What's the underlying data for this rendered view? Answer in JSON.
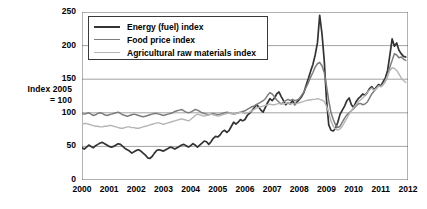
{
  "chart_data": {
    "type": "line",
    "title": "",
    "xlabel": "",
    "ylabel": "Index 2005 = 100",
    "ylabel_lines": [
      "Index 2005",
      "= 100"
    ],
    "ylim": [
      0,
      250
    ],
    "xlim": [
      2000,
      2012
    ],
    "yticks": [
      0,
      50,
      100,
      150,
      200,
      250
    ],
    "xticks": [
      2000,
      2001,
      2002,
      2003,
      2004,
      2005,
      2006,
      2007,
      2008,
      2009,
      2010,
      2011,
      2012
    ],
    "grid": "horizontal",
    "legend_position": "top-left-inside",
    "series": [
      {
        "name": "Energy (fuel) index",
        "color": "#333333",
        "width": 1.7,
        "x_start": 2000.0,
        "x_step": 0.08333,
        "values": [
          48,
          46,
          49,
          52,
          50,
          48,
          51,
          53,
          55,
          56,
          54,
          52,
          50,
          49,
          50,
          52,
          54,
          53,
          50,
          47,
          45,
          43,
          40,
          42,
          44,
          45,
          43,
          40,
          37,
          33,
          32,
          35,
          40,
          44,
          45,
          44,
          43,
          45,
          47,
          49,
          48,
          46,
          48,
          50,
          52,
          53,
          51,
          49,
          51,
          54,
          52,
          49,
          52,
          55,
          58,
          57,
          53,
          57,
          62,
          65,
          64,
          67,
          72,
          74,
          71,
          74,
          80,
          86,
          83,
          86,
          90,
          88,
          90,
          96,
          99,
          103,
          107,
          112,
          109,
          104,
          101,
          108,
          115,
          121,
          118,
          122,
          128,
          131,
          124,
          118,
          112,
          115,
          113,
          118,
          112,
          116,
          120,
          124,
          130,
          141,
          151,
          162,
          172,
          186,
          204,
          245,
          218,
          178,
          120,
          82,
          74,
          73,
          77,
          86,
          98,
          104,
          110,
          118,
          122,
          112,
          108,
          116,
          121,
          124,
          128,
          126,
          130,
          136,
          139,
          134,
          138,
          142,
          140,
          146,
          152,
          163,
          186,
          210,
          199,
          204,
          193,
          188,
          184,
          183
        ]
      },
      {
        "name": "Food price index",
        "color": "#7d7d7d",
        "width": 1.5,
        "x_start": 2000.0,
        "x_step": 0.08333,
        "values": [
          99,
          98,
          99,
          100,
          98,
          96,
          97,
          99,
          100,
          99,
          97,
          96,
          97,
          98,
          99,
          100,
          101,
          99,
          97,
          96,
          95,
          96,
          97,
          98,
          97,
          96,
          95,
          94,
          95,
          96,
          97,
          98,
          99,
          99,
          98,
          97,
          96,
          97,
          98,
          99,
          100,
          102,
          103,
          104,
          105,
          103,
          101,
          100,
          101,
          103,
          105,
          104,
          102,
          100,
          99,
          98,
          97,
          98,
          99,
          98,
          97,
          98,
          99,
          100,
          101,
          100,
          99,
          98,
          99,
          100,
          101,
          102,
          103,
          105,
          107,
          109,
          110,
          112,
          114,
          116,
          118,
          121,
          126,
          130,
          128,
          124,
          119,
          116,
          113,
          116,
          118,
          120,
          118,
          120,
          118,
          119,
          121,
          126,
          131,
          138,
          145,
          153,
          160,
          168,
          173,
          175,
          170,
          160,
          140,
          118,
          100,
          90,
          82,
          78,
          80,
          86,
          92,
          97,
          100,
          103,
          106,
          110,
          113,
          114,
          112,
          113,
          116,
          122,
          128,
          132,
          136,
          140,
          139,
          142,
          147,
          155,
          168,
          178,
          188,
          186,
          182,
          183,
          180,
          178
        ]
      },
      {
        "name": "Agricultural raw materials index",
        "color": "#b5b5b5",
        "width": 1.4,
        "x_start": 2000.0,
        "x_step": 0.08333,
        "values": [
          83,
          84,
          84,
          83,
          82,
          81,
          80,
          80,
          79,
          79,
          80,
          80,
          81,
          81,
          80,
          79,
          78,
          77,
          77,
          78,
          79,
          79,
          78,
          78,
          77,
          77,
          78,
          79,
          80,
          81,
          82,
          83,
          84,
          85,
          85,
          84,
          83,
          84,
          85,
          86,
          87,
          88,
          89,
          90,
          91,
          90,
          89,
          88,
          90,
          93,
          96,
          98,
          97,
          96,
          95,
          96,
          97,
          98,
          97,
          96,
          95,
          96,
          97,
          98,
          99,
          100,
          99,
          98,
          99,
          100,
          101,
          100,
          99,
          100,
          101,
          103,
          105,
          107,
          108,
          109,
          110,
          111,
          112,
          113,
          112,
          112,
          113,
          114,
          113,
          113,
          114,
          115,
          113,
          114,
          113,
          114,
          115,
          116,
          117,
          118,
          119,
          119,
          120,
          120,
          121,
          120,
          119,
          117,
          110,
          100,
          88,
          80,
          76,
          74,
          76,
          80,
          86,
          92,
          98,
          103,
          108,
          112,
          116,
          119,
          122,
          126,
          130,
          134,
          137,
          133,
          136,
          140,
          139,
          142,
          147,
          155,
          163,
          167,
          166,
          163,
          158,
          152,
          148,
          145
        ]
      }
    ]
  },
  "axis": {
    "y_title_line1": "Index 2005",
    "y_title_line2": "= 100",
    "yticks": [
      "0",
      "50",
      "100",
      "150",
      "200",
      "250"
    ],
    "xticks": [
      "2000",
      "2001",
      "2002",
      "2003",
      "2004",
      "2005",
      "2006",
      "2007",
      "2008",
      "2009",
      "2010",
      "2011",
      "2012"
    ]
  },
  "legend": {
    "items": [
      {
        "label": "Energy (fuel) index"
      },
      {
        "label": "Food price index"
      },
      {
        "label": "Agricultural raw materials index"
      }
    ]
  }
}
